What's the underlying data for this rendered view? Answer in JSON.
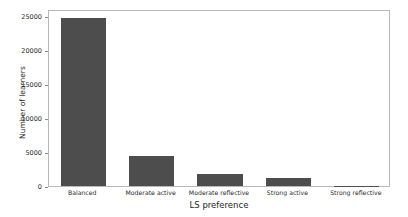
{
  "chart_data": {
    "type": "bar",
    "title": "",
    "xlabel": "LS preference",
    "ylabel": "Number of learners",
    "categories": [
      "Balanced",
      "Moderate active",
      "Moderate reflective",
      "Strong active",
      "Strong reflective"
    ],
    "values": [
      24700,
      4350,
      1750,
      1150,
      50
    ],
    "ylim": [
      0,
      26000
    ],
    "yticks": [
      0,
      5000,
      10000,
      15000,
      20000,
      25000
    ],
    "ytick_labels": [
      "0",
      "5000",
      "10000",
      "15000",
      "20000",
      "25000"
    ],
    "grid": false,
    "legend": null,
    "bar_color": "#4d4d4d",
    "background_color": "#ffffff",
    "axis_color": "#b9b9b9"
  }
}
